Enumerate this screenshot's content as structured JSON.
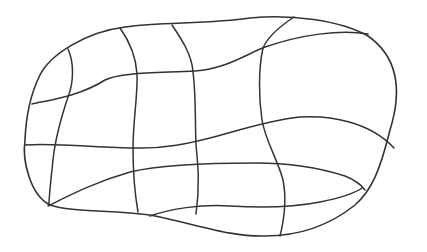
{
  "figure": {
    "stroke_color": "#333333",
    "background": "#ffffff",
    "outline": "M40,75 C50,55 85,32 125,27 C160,22 210,24 250,18 C290,14 340,20 368,36 C395,55 404,85 390,130 C380,170 372,190 355,205 C330,225 300,236 265,236 C230,237 200,225 150,215 C110,210 70,212 50,205 C30,195 22,160 25,140 C26,115 30,95 40,75 Z",
    "horizontal_lines": [
      "M32,104 C50,100 80,96 105,80 C120,72 160,73 195,71 C225,69 245,55 265,47 C300,35 340,29 368,34",
      "M25,145 C60,143 100,148 135,148 C165,149 190,143 210,138 C240,130 270,120 300,117 C330,115 370,122 394,148",
      "M48,206 C70,195 95,182 130,172 C160,165 200,163 255,163 C290,163 320,168 345,176 C355,180 362,186 365,190",
      "M150,216 C170,209 200,204 230,206 C260,208 290,208 320,202 C340,198 355,193 362,188"
    ],
    "vertical_lines": [
      "M68,49 C74,62 74,82 68,97 C62,115 55,140 53,160 C51,180 49,195 49,205",
      "M120,28 C130,42 136,58 137,74 C138,95 133,120 133,148 C133,175 135,195 138,212",
      "M172,25 C182,40 192,55 193,72 C196,95 195,120 196,145 C198,165 200,185 196,214",
      "M294,17 C282,25 268,36 263,48 C258,70 259,100 262,120 C265,140 278,160 283,180 C287,200 284,220 280,236"
    ]
  }
}
